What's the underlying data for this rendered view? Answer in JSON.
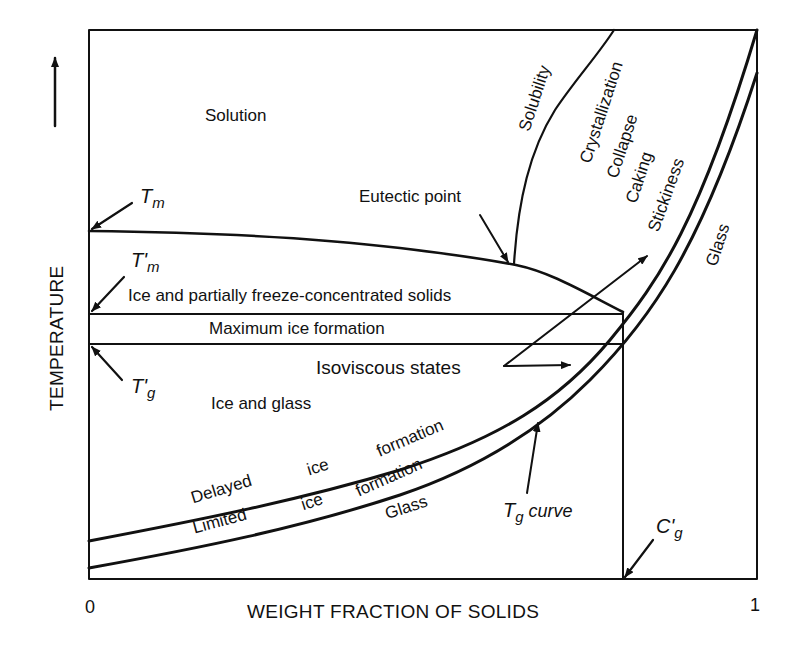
{
  "figure": {
    "x_axis": {
      "label": "WEIGHT FRACTION OF SOLIDS",
      "tick_min": "0",
      "tick_max": "1"
    },
    "y_axis": {
      "label": "TEMPERATURE",
      "direction_icon": "arrow-up-icon"
    }
  },
  "markers": {
    "tm": {
      "main": "T",
      "sub": "m"
    },
    "tm_prime": {
      "main": "T'",
      "sub": "m"
    },
    "tg_prime": {
      "main": "T'",
      "sub": "g"
    },
    "cg_prime": {
      "main": "C'",
      "sub": "g"
    },
    "tg_curve": {
      "main": "T",
      "sub": "g",
      "suffix": " curve"
    }
  },
  "regions": {
    "solution": "Solution",
    "eutectic_point": "Eutectic point",
    "ice_partial": "Ice and partially freeze-concentrated solids",
    "max_ice": "Maximum ice formation",
    "isoviscous": "Isoviscous states",
    "ice_glass": "Ice and glass",
    "glass_lower": "Glass",
    "glass_right": "Glass"
  },
  "curve_labels": {
    "solubility": "Solubility",
    "crystallization": "Crystallization",
    "collapse": "Collapse",
    "caking": "Caking",
    "stickiness": "Stickiness",
    "delayed": "Delayed",
    "delayed_ice": "ice",
    "delayed_formation": "formation",
    "limited": "Limited",
    "limited_ice": "ice",
    "limited_formation": "formation"
  }
}
